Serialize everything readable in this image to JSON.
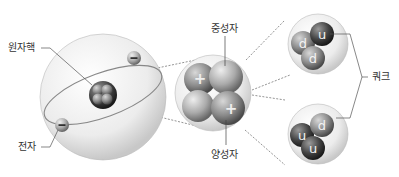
{
  "labels": {
    "nucleus": "원자핵",
    "electron": "전자",
    "neutron": "중성자",
    "proton": "양성자",
    "quark": "쿼크"
  },
  "symbols": {
    "electron_charge": "−",
    "proton_charge": "+",
    "neutron_quarks": [
      "d",
      "u",
      "d"
    ],
    "proton_quarks": [
      "u",
      "d",
      "u"
    ]
  }
}
